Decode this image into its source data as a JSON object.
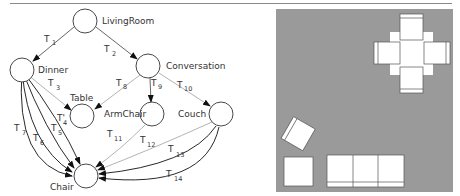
{
  "graph": {
    "nodes": [
      {
        "id": "livingroom",
        "label": "LivingRoom"
      },
      {
        "id": "dinner",
        "label": "Dinner"
      },
      {
        "id": "conversation",
        "label": "Conversation"
      },
      {
        "id": "table",
        "label": "Table"
      },
      {
        "id": "armchair",
        "label": "ArmChair"
      },
      {
        "id": "couch",
        "label": "Couch"
      },
      {
        "id": "chair",
        "label": "Chair"
      }
    ],
    "edges": [
      {
        "label": "T",
        "sub": "1",
        "from": "LivingRoom",
        "to": "Dinner"
      },
      {
        "label": "T",
        "sub": "2",
        "from": "LivingRoom",
        "to": "Conversation"
      },
      {
        "label": "T",
        "sub": "3",
        "from": "Dinner",
        "to": "Table"
      },
      {
        "label": "T'",
        "sub": "4",
        "from": "Dinner",
        "to": "Chair"
      },
      {
        "label": "T",
        "sub": "5",
        "from": "Dinner",
        "to": "Chair"
      },
      {
        "label": "T",
        "sub": "6",
        "from": "Dinner",
        "to": "Chair"
      },
      {
        "label": "T",
        "sub": "7",
        "from": "Dinner",
        "to": "Chair"
      },
      {
        "label": "T",
        "sub": "8",
        "from": "Conversation",
        "to": "Table"
      },
      {
        "label": "T",
        "sub": "9",
        "from": "Conversation",
        "to": "ArmChair"
      },
      {
        "label": "T",
        "sub": "10",
        "from": "Conversation",
        "to": "Couch"
      },
      {
        "label": "T",
        "sub": "11",
        "from": "ArmChair",
        "to": "Chair"
      },
      {
        "label": "T",
        "sub": "12",
        "from": "Couch",
        "to": "Chair"
      },
      {
        "label": "T",
        "sub": "13",
        "from": "Couch",
        "to": "Chair"
      },
      {
        "label": "T",
        "sub": "14",
        "from": "Couch",
        "to": "Chair"
      }
    ]
  },
  "floorplan": {
    "background_color": "#9a9a9a",
    "furniture_color": "#ffffff",
    "items": [
      "dining-table",
      "dining-chair-top",
      "dining-chair-left",
      "dining-chair-right",
      "dining-chair-bottom",
      "armchair",
      "side-table",
      "couch"
    ]
  }
}
